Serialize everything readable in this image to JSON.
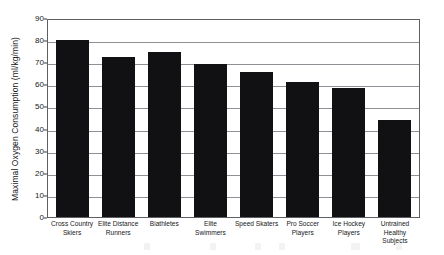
{
  "chart_data": {
    "type": "bar",
    "title": "",
    "xlabel": "",
    "ylabel": "Maximal Oxygen Consumption (ml/kg/min)",
    "ylim": [
      0,
      90
    ],
    "ytick_step": 10,
    "yticks": [
      90,
      80,
      70,
      60,
      50,
      40,
      30,
      20,
      10,
      0
    ],
    "grid": true,
    "legend": false,
    "bar_color": "#111113",
    "frame_color": "#5d5f62",
    "gridline_color": "#8d9094",
    "categories": [
      "Cross Country Skiers",
      "Elite Distance Runners",
      "Biathletes",
      "Elite Swimmers",
      "Speed Skaters",
      "Pro Soccer Players",
      "Ice Hockey Players",
      "Untrained Healthy Subjects"
    ],
    "values": [
      80,
      72.5,
      74.5,
      69,
      65.5,
      61,
      58.5,
      44
    ]
  }
}
